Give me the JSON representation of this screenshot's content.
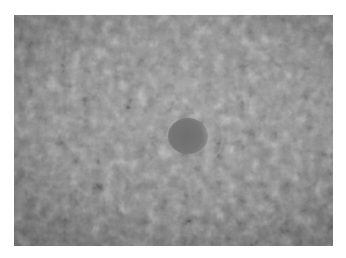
{
  "image": {
    "description": "Grayscale close-up photograph of a textured surface (skin-like) with a darker roughly circular spot near the center, surrounded by a faint lighter ring; framed by a white border.",
    "colors": {
      "border": "#ffffff",
      "surface": "#8a8a8a",
      "spot": "#6f6f6f",
      "halo": "#aaaaaa"
    },
    "features": [
      {
        "name": "dark-spot",
        "approx_center_px": [
          185,
          138
        ],
        "approx_size_px": [
          40,
          36
        ]
      },
      {
        "name": "light-halo",
        "approx_center_px": [
          191,
          136
        ],
        "approx_size_px": [
          58,
          52
        ]
      }
    ]
  }
}
